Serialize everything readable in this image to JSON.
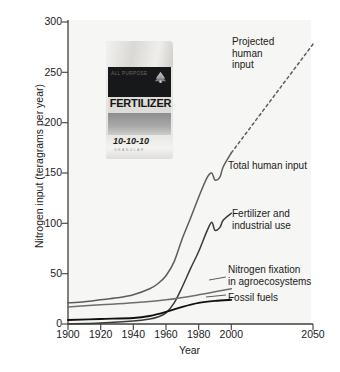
{
  "chart_data": {
    "type": "line",
    "title": "",
    "xlabel": "Year",
    "ylabel": "Nitrogen input (teragrams per year)",
    "xlim": [
      1900,
      2050
    ],
    "ylim": [
      0,
      300
    ],
    "xticks": [
      1900,
      1920,
      1940,
      1960,
      1980,
      2000,
      2050
    ],
    "yticks": [
      0,
      50,
      100,
      150,
      200,
      250,
      300
    ],
    "grid": false,
    "legend_position": "inline-annotations",
    "series": [
      {
        "name": "Total human input",
        "color": "#5c5c5c",
        "style": "solid",
        "x": [
          1900,
          1910,
          1920,
          1930,
          1940,
          1950,
          1955,
          1960,
          1965,
          1970,
          1975,
          1980,
          1985,
          1988,
          1990,
          1993,
          1995,
          2000
        ],
        "values": [
          21,
          22,
          24,
          26,
          29,
          35,
          40,
          48,
          62,
          85,
          105,
          126,
          145,
          150,
          143,
          146,
          156,
          170
        ]
      },
      {
        "name": "Fertilizer and industrial use",
        "color": "#3a3a3a",
        "style": "solid",
        "x": [
          1900,
          1920,
          1940,
          1950,
          1955,
          1960,
          1965,
          1970,
          1975,
          1980,
          1985,
          1988,
          1990,
          1993,
          1995,
          2000
        ],
        "values": [
          0,
          1,
          3,
          5,
          7,
          11,
          21,
          37,
          55,
          72,
          92,
          101,
          93,
          96,
          103,
          110
        ]
      },
      {
        "name": "Nitrogen fixation in agroecosystems",
        "color": "#6e6e6e",
        "style": "solid",
        "x": [
          1900,
          1920,
          1940,
          1960,
          1980,
          2000
        ],
        "values": [
          17,
          19,
          21,
          24,
          29,
          35
        ]
      },
      {
        "name": "Fossil fuels",
        "color": "#111111",
        "style": "solid",
        "x": [
          1900,
          1920,
          1940,
          1950,
          1960,
          1970,
          1980,
          1990,
          2000
        ],
        "values": [
          4,
          5,
          6,
          8,
          12,
          17,
          21,
          23,
          24
        ]
      },
      {
        "name": "Projected human input",
        "color": "#5c5c5c",
        "style": "dashed",
        "x": [
          2000,
          2050
        ],
        "values": [
          170,
          278
        ]
      }
    ],
    "annotations": [
      {
        "name": "projected-human-input",
        "text": "Projected\nhuman\ninput"
      },
      {
        "name": "total-human-input",
        "text": "Total human input"
      },
      {
        "name": "fertilizer-and-industrial-use",
        "text": "Fertilizer and\nindustrial use"
      },
      {
        "name": "nitrogen-fixation-in-agroecosystems",
        "text": "Nitrogen fixation\nin agroecosystems"
      },
      {
        "name": "fossil-fuels",
        "text": "Fossil fuels"
      }
    ]
  },
  "inset_image": {
    "kind": "photo",
    "subject": "fertilizer-bag",
    "brand_text": "ALL PURPOSE",
    "product_text": "FERTILIZER",
    "npk_text": "10-10-10",
    "sub_text": "GRANULAR"
  },
  "colors": {
    "plot_background": "#f6f6f4",
    "axis": "#444444",
    "text": "#1a1a1a"
  }
}
